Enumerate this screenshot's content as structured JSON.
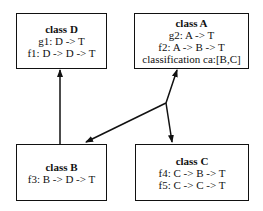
{
  "diagram": {
    "type": "class-hierarchy",
    "classes": {
      "D": {
        "title": "class D",
        "members": [
          "g1: D -> T",
          "f1: D -> D -> T"
        ]
      },
      "A": {
        "title": "class A",
        "members": [
          "g2: A -> T",
          "f2: A -> B -> T",
          "classification ca:[B,C]"
        ]
      },
      "B": {
        "title": "class B",
        "members": [
          "f3: B -> D -> T"
        ]
      },
      "C": {
        "title": "class C",
        "members": [
          "f4: C -> B -> T",
          "f5: C -> C -> T"
        ]
      }
    },
    "edges": [
      {
        "from": "B",
        "to": "D",
        "style": "arrow"
      },
      {
        "from": "classification-junction",
        "to": "A",
        "style": "arrow"
      },
      {
        "from": "classification-junction",
        "to": "B",
        "style": "arrow"
      },
      {
        "from": "classification-junction",
        "to": "C",
        "style": "arrow"
      }
    ],
    "colors": {
      "stroke": "#111111",
      "background": "#ffffff"
    }
  }
}
